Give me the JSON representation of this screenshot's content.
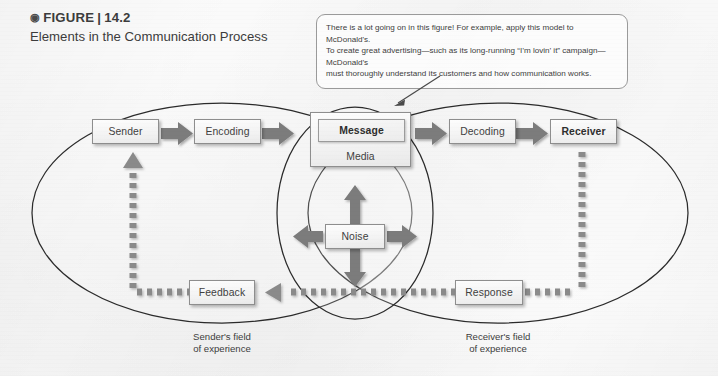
{
  "figure": {
    "bullet_icon": "circled-bullet-icon",
    "label": "FIGURE",
    "separator": "|",
    "number": "14.2",
    "title": "Elements in the Communication Process"
  },
  "callout": {
    "line1": "There is a lot going on in this figure!  For example, apply this model to McDonald's.",
    "line2": "To create great advertising—such as its long-running “I’m lovin’ it” campaign—McDonald’s",
    "line3": "must thoroughly understand its customers and how communication works."
  },
  "diagram": {
    "nodes": {
      "sender": "Sender",
      "encoding": "Encoding",
      "message": "Message",
      "media": "Media",
      "decoding": "Decoding",
      "receiver": "Receiver",
      "noise": "Noise",
      "feedback": "Feedback",
      "response": "Response"
    },
    "field_labels": {
      "sender_field_line1": "Sender's field",
      "sender_field_line2": "of experience",
      "receiver_field_line1": "Receiver's field",
      "receiver_field_line2": "of experience"
    },
    "colors": {
      "arrow_solid": "#7b7b7b",
      "arrow_dashed": "#8a8a8a",
      "ellipse_stroke": "#2a2a2a",
      "box_border": "#8e8e8e",
      "box_fill": "#f4f4f4",
      "page_background": "#fbfbfb"
    }
  }
}
